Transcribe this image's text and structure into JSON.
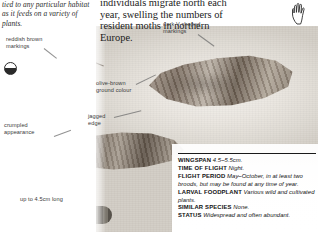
{
  "page": {
    "width": 318,
    "height": 232,
    "background": "#ffffff"
  },
  "body_text": {
    "left_italic": "tied to any particular habitat as it feeds on a variety of plants.",
    "right_roman": "individuals migrate north each year, swelling the numbers of resident moths in northern Europe."
  },
  "annotations": [
    {
      "id": "reddish-brown-markings",
      "text": "reddish brown\nmarkings",
      "x": 6,
      "y": 36
    },
    {
      "id": "crumpled-appearance",
      "text": "crumpled\nappearance",
      "x": 4,
      "y": 122
    },
    {
      "id": "up-to-4-5cm-long",
      "text": "up to 4.5cm long",
      "x": 20,
      "y": 196
    },
    {
      "id": "olive-brown-ground-colour",
      "text": "olive-brown\nground colour",
      "x": 96,
      "y": 80
    },
    {
      "id": "jagged-edge",
      "text": "jagged\nedge",
      "x": 88,
      "y": 113
    },
    {
      "id": "dark-v-shaped-markings",
      "text": "dark V-shaped\nmarkings",
      "x": 163,
      "y": 21
    }
  ],
  "icons": {
    "magnifier_dot": "half-filled-circle-icon",
    "hand": "hand-silhouette-icon"
  },
  "data_panel": {
    "rows": [
      {
        "key": "WINGSPAN",
        "value": "4.5–5.5cm."
      },
      {
        "key": "TIME OF FLIGHT",
        "value": "Night."
      },
      {
        "key": "FLIGHT PERIOD",
        "value": "May–October, in at least two broods, but may be found at any time of year."
      },
      {
        "key": "LARVAL FOODPLANT",
        "value": "Various wild and cultivated plants."
      },
      {
        "key": "SIMILAR SPECIES",
        "value": "None."
      },
      {
        "key": "STATUS",
        "value": "Widespread and often abundant."
      }
    ]
  },
  "colors": {
    "text": "#111111",
    "annotation": "#3a3a3a",
    "plate_light": "#f3f0ec",
    "plate_dark": "#d2cdc5"
  }
}
